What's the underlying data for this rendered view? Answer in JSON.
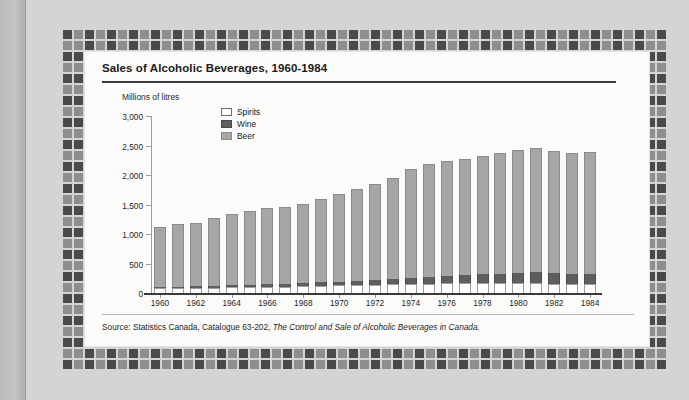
{
  "figure": {
    "title": "Sales of Alcoholic Beverages, 1960-1984",
    "axis_title": "Millions of litres",
    "source_prefix": "Source: Statistics Canada, Catalogue 63-202, ",
    "source_italic": "The Control and Sale of Alcoholic Beverages in Canada.",
    "colors": {
      "spirits": "#ffffff",
      "wine": "#5e5e5e",
      "beer": "#a6a6a4",
      "frame_dark": "#4a4a4a",
      "frame_mid": "#8e8e8e",
      "panel": "#fbfbfa",
      "paper": "#d4d4d2"
    }
  },
  "legend": {
    "position": "inside-top-left",
    "items": [
      {
        "label": "Spirits",
        "swatch": "sw-spirits"
      },
      {
        "label": "Wine",
        "swatch": "sw-wine"
      },
      {
        "label": "Beer",
        "swatch": "sw-beer"
      }
    ]
  },
  "chart_data": {
    "type": "bar",
    "subtype": "stacked-vertical",
    "title": "Sales of Alcoholic Beverages, 1960-1984",
    "xlabel": "",
    "ylabel": "Millions of litres",
    "ylim": [
      0,
      3000
    ],
    "yticks": [
      0,
      500,
      1000,
      1500,
      2000,
      2500,
      3000
    ],
    "ytick_labels": [
      "0",
      "500",
      "1,000",
      "1,500",
      "2,000",
      "2,500",
      "3,000"
    ],
    "grid": false,
    "legend_entries": [
      "Spirits",
      "Wine",
      "Beer"
    ],
    "categories": [
      1960,
      1961,
      1962,
      1963,
      1964,
      1965,
      1966,
      1967,
      1968,
      1969,
      1970,
      1971,
      1972,
      1973,
      1974,
      1975,
      1976,
      1977,
      1978,
      1979,
      1980,
      1981,
      1982,
      1983,
      1984
    ],
    "xtick_labels": [
      "1960",
      "1962",
      "1964",
      "1966",
      "1968",
      "1970",
      "1972",
      "1974",
      "1976",
      "1978",
      "1980",
      "1982",
      "1984"
    ],
    "series": [
      {
        "name": "Spirits",
        "values": [
          80,
          82,
          85,
          90,
          95,
          100,
          105,
          110,
          118,
          125,
          130,
          135,
          140,
          148,
          155,
          160,
          162,
          163,
          165,
          168,
          170,
          168,
          160,
          152,
          150
        ]
      },
      {
        "name": "Wine",
        "values": [
          25,
          26,
          28,
          30,
          33,
          36,
          40,
          44,
          50,
          56,
          62,
          70,
          80,
          92,
          105,
          118,
          130,
          140,
          150,
          162,
          175,
          180,
          178,
          175,
          175
        ]
      },
      {
        "name": "Beer",
        "values": [
          1020,
          1057,
          1082,
          1155,
          1217,
          1249,
          1300,
          1306,
          1337,
          1414,
          1483,
          1560,
          1635,
          1715,
          1835,
          1902,
          1938,
          1967,
          2012,
          2045,
          2080,
          2102,
          2062,
          2053,
          2060
        ]
      }
    ],
    "totals": [
      1125,
      1165,
      1195,
      1275,
      1345,
      1385,
      1445,
      1460,
      1505,
      1595,
      1675,
      1765,
      1855,
      1955,
      2095,
      2180,
      2230,
      2270,
      2327,
      2375,
      2425,
      2450,
      2400,
      2380,
      2385
    ]
  }
}
